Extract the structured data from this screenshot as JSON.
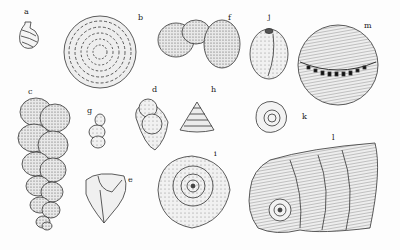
{
  "figure": {
    "specimens": [
      {
        "label": "a",
        "x": 24,
        "y": 14,
        "shape": "coiled-uniserial"
      },
      {
        "label": "b",
        "x": 138,
        "y": 18,
        "shape": "planispiral-disc"
      },
      {
        "label": "c",
        "x": 28,
        "y": 92,
        "shape": "biserial-elongate"
      },
      {
        "label": "d",
        "x": 152,
        "y": 88,
        "shape": "trochoid-globular"
      },
      {
        "label": "e",
        "x": 128,
        "y": 178,
        "shape": "triangular-angular"
      },
      {
        "label": "f",
        "x": 228,
        "y": 18,
        "shape": "globular-chambers"
      },
      {
        "label": "g",
        "x": 87,
        "y": 110,
        "shape": "small-irregular"
      },
      {
        "label": "h",
        "x": 211,
        "y": 88,
        "shape": "conical-trochospiral"
      },
      {
        "label": "i",
        "x": 214,
        "y": 152,
        "shape": "planispiral-involute"
      },
      {
        "label": "j",
        "x": 268,
        "y": 17,
        "shape": "oval-miliolid"
      },
      {
        "label": "k",
        "x": 302,
        "y": 117,
        "shape": "small-coiled"
      },
      {
        "label": "l",
        "x": 332,
        "y": 136,
        "shape": "fan-spiral"
      },
      {
        "label": "m",
        "x": 364,
        "y": 24,
        "shape": "spherical-ribbed"
      }
    ]
  }
}
